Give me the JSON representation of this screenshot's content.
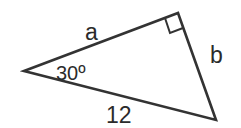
{
  "diagram": {
    "type": "right-triangle",
    "labels": {
      "side_a": "a",
      "side_b": "b",
      "hypotenuse": "12",
      "angle": "30º"
    },
    "right_angle_marker": true,
    "stroke_color": "#333333",
    "background": "#ffffff"
  }
}
